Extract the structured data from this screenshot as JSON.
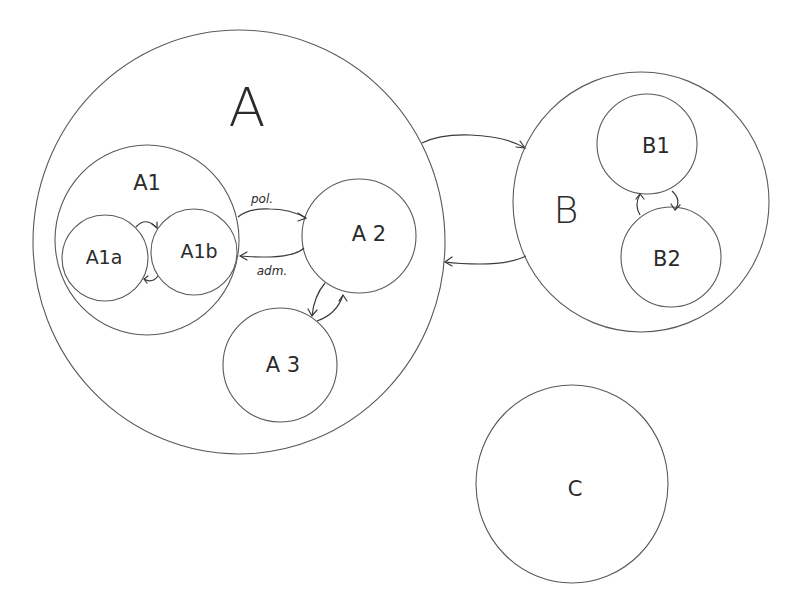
{
  "diagram": {
    "type": "nested-set hand drawing",
    "colors": {
      "background": "#ffffff",
      "stroke": "#5a5a5a",
      "text": "#2b2b2b"
    },
    "nodes": {
      "A": {
        "label": "A"
      },
      "A1": {
        "label": "A1"
      },
      "A1a": {
        "label": "A1a"
      },
      "A1b": {
        "label": "A1b"
      },
      "A2": {
        "label": "A 2"
      },
      "A3": {
        "label": "A 3"
      },
      "B": {
        "label": "B"
      },
      "B1": {
        "label": "B1"
      },
      "B2": {
        "label": "B2"
      },
      "C": {
        "label": "C"
      }
    },
    "edges": [
      {
        "from": "A1a",
        "to": "A1b",
        "label": ""
      },
      {
        "from": "A1b",
        "to": "A1a",
        "label": ""
      },
      {
        "from": "A1",
        "to": "A2",
        "label": "pol."
      },
      {
        "from": "A2",
        "to": "A1",
        "label": "adm."
      },
      {
        "from": "A2",
        "to": "A3",
        "label": ""
      },
      {
        "from": "A3",
        "to": "A2",
        "label": ""
      },
      {
        "from": "A",
        "to": "B",
        "label": ""
      },
      {
        "from": "B",
        "to": "A",
        "label": ""
      },
      {
        "from": "B1",
        "to": "B2",
        "label": ""
      },
      {
        "from": "B2",
        "to": "B1",
        "label": ""
      }
    ],
    "edge_labels": {
      "pol": "pol.",
      "adm": "adm."
    }
  }
}
